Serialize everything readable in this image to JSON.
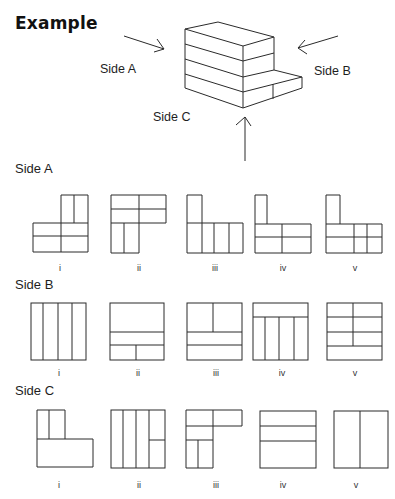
{
  "title": "Example",
  "example": {
    "labels": {
      "side_a": "Side A",
      "side_b": "Side B",
      "side_c": "Side C"
    }
  },
  "sections": [
    {
      "name": "Side A",
      "options": [
        "i",
        "ii",
        "iii",
        "iv",
        "v"
      ]
    },
    {
      "name": "Side B",
      "options": [
        "i",
        "ii",
        "iii",
        "iv",
        "v"
      ]
    },
    {
      "name": "Side C",
      "options": [
        "i",
        "ii",
        "iii",
        "iv",
        "v"
      ]
    }
  ]
}
